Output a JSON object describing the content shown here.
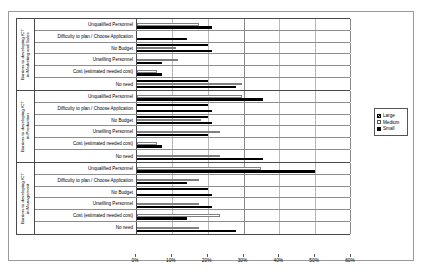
{
  "chart_data": {
    "type": "bar",
    "orientation": "horizontal",
    "title": "",
    "xlabel": "",
    "ylabel": "",
    "xlim": [
      0,
      60
    ],
    "xticks": [
      "0%",
      "10%",
      "20%",
      "30%",
      "40%",
      "50%",
      "60%"
    ],
    "grid": true,
    "legend_position": "right",
    "series_names": [
      "Large",
      "Medium",
      "Small"
    ],
    "categories": [
      "Unqualified Personnel",
      "Difficulty to plan / Choose Application",
      "No Budget",
      "Unwilling Personnel",
      "Cost (estimated needed cost)",
      "No need"
    ],
    "groups": [
      {
        "name": "Barriers to developing ICT\nin Marketing and Sales",
        "rows": [
          {
            "label": "Unqualified Personnel",
            "Large": 0.0,
            "Medium": 17.5,
            "Small": 21.0
          },
          {
            "label": "Difficulty to plan / Choose Application",
            "Large": 0.0,
            "Medium": 0.0,
            "Small": 14.0
          },
          {
            "label": "No Budget",
            "Large": 20.0,
            "Medium": 11.0,
            "Small": 21.0
          },
          {
            "label": "Unwilling Personnel",
            "Large": 0.0,
            "Medium": 11.5,
            "Small": 7.0
          },
          {
            "label": "Cost (estimated needed cost)",
            "Large": 0.0,
            "Medium": 5.5,
            "Small": 7.0
          },
          {
            "label": "No need",
            "Large": 20.0,
            "Medium": 29.5,
            "Small": 28.0
          }
        ]
      },
      {
        "name": "Barriers to developing ICT\nin Production",
        "rows": [
          {
            "label": "Unqualified Personnel",
            "Large": 0.0,
            "Medium": 29.5,
            "Small": 35.5
          },
          {
            "label": "Difficulty to plan / Choose Application",
            "Large": 20.0,
            "Medium": 0.0,
            "Small": 21.0
          },
          {
            "label": "No Budget",
            "Large": 20.0,
            "Medium": 18.0,
            "Small": 21.0
          },
          {
            "label": "Unwilling Personnel",
            "Large": 0.0,
            "Medium": 23.5,
            "Small": 20.0
          },
          {
            "label": "Cost (estimated needed cost)",
            "Large": 0.0,
            "Medium": 5.5,
            "Small": 7.0
          },
          {
            "label": "No need",
            "Large": 0.0,
            "Medium": 23.5,
            "Small": 35.5
          }
        ]
      },
      {
        "name": "Barriers to developing ICT\nin Management",
        "rows": [
          {
            "label": "Unqualified Personnel",
            "Large": 0.0,
            "Medium": 35.0,
            "Small": 50.0
          },
          {
            "label": "Difficulty to plan / Choose Application",
            "Large": 0.0,
            "Medium": 17.5,
            "Small": 14.0
          },
          {
            "label": "No Budget",
            "Large": 20.0,
            "Medium": 0.0,
            "Small": 21.0
          },
          {
            "label": "Unwilling Personnel",
            "Large": 0.0,
            "Medium": 17.5,
            "Small": 21.0
          },
          {
            "label": "Cost (estimated needed cost)",
            "Large": 0.0,
            "Medium": 23.5,
            "Small": 14.0
          },
          {
            "label": "No need",
            "Large": 0.0,
            "Medium": 17.5,
            "Small": 28.0
          }
        ]
      }
    ]
  },
  "legend": {
    "items": [
      {
        "label": "Large",
        "style": "hatched"
      },
      {
        "label": "Medium",
        "style": "white"
      },
      {
        "label": "Small",
        "style": "black"
      }
    ]
  },
  "colors": {
    "small": "#000000",
    "medium": "#ffffff",
    "large_hatch": "#000000",
    "gridline": "#b9b9b9",
    "frame": "#9a9a9a"
  }
}
